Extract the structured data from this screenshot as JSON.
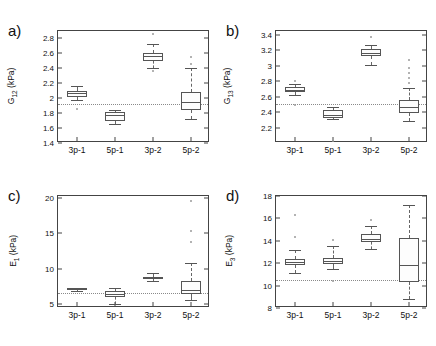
{
  "figure": {
    "background": "#ffffff",
    "panel_letters": [
      "a)",
      "b)",
      "c)",
      "d)"
    ]
  },
  "chart_data": [
    {
      "type": "box",
      "panel": "a)",
      "title": "",
      "xlabel": "",
      "ylabel": "G12 (kPa)",
      "ylabel_base": "G",
      "ylabel_sub": "12",
      "ylabel_units": "(kPa)",
      "categories": [
        "3p-1",
        "5p-1",
        "3p-2",
        "5p-2"
      ],
      "ylim": [
        1.4,
        2.9
      ],
      "yticks": [
        1.4,
        1.6,
        1.8,
        2.0,
        2.2,
        2.4,
        2.6,
        2.8
      ],
      "ytick_labels": [
        "1.4",
        "1.6",
        "1.8",
        "2",
        "2.2",
        "2.4",
        "2.6",
        "2.8"
      ],
      "grid": false,
      "reference_line": 1.92,
      "boxes": [
        {
          "category": "3p-1",
          "whisker_low": 1.97,
          "q1": 2.02,
          "median": 2.07,
          "q3": 2.1,
          "whisker_high": 2.16,
          "outliers": [
            1.86
          ]
        },
        {
          "category": "5p-1",
          "whisker_low": 1.65,
          "q1": 1.7,
          "median": 1.78,
          "q3": 1.81,
          "whisker_high": 1.84,
          "outliers": []
        },
        {
          "category": "3p-2",
          "whisker_low": 2.41,
          "q1": 2.5,
          "median": 2.56,
          "q3": 2.6,
          "whisker_high": 2.72,
          "outliers": [
            2.86,
            2.37
          ]
        },
        {
          "category": "5p-2",
          "whisker_low": 1.72,
          "q1": 1.84,
          "median": 1.95,
          "q3": 2.08,
          "whisker_high": 2.4,
          "outliers": [
            2.55,
            2.46
          ]
        }
      ]
    },
    {
      "type": "box",
      "panel": "b)",
      "title": "",
      "xlabel": "",
      "ylabel": "G13 (kPa)",
      "ylabel_base": "G",
      "ylabel_sub": "13",
      "ylabel_units": "(kPa)",
      "categories": [
        "3p-1",
        "5p-1",
        "3p-2",
        "5p-2"
      ],
      "ylim": [
        2.0,
        3.45
      ],
      "yticks": [
        2.2,
        2.4,
        2.6,
        2.8,
        3.0,
        3.2,
        3.4
      ],
      "ytick_labels": [
        "2.2",
        "2.4",
        "2.6",
        "2.8",
        "3",
        "3.2",
        "3.4"
      ],
      "grid": false,
      "reference_line": 2.5,
      "boxes": [
        {
          "category": "3p-1",
          "whisker_low": 2.62,
          "q1": 2.66,
          "median": 2.69,
          "q3": 2.72,
          "whisker_high": 2.76,
          "outliers": [
            2.8,
            2.49
          ]
        },
        {
          "category": "5p-1",
          "whisker_low": 2.31,
          "q1": 2.33,
          "median": 2.36,
          "q3": 2.43,
          "whisker_high": 2.47,
          "outliers": [
            2.03
          ]
        },
        {
          "category": "3p-2",
          "whisker_low": 3.01,
          "q1": 3.12,
          "median": 3.17,
          "q3": 3.22,
          "whisker_high": 3.27,
          "outliers": [
            3.37
          ]
        },
        {
          "category": "5p-2",
          "whisker_low": 2.28,
          "q1": 2.39,
          "median": 2.47,
          "q3": 2.56,
          "whisker_high": 2.71,
          "outliers": [
            3.07,
            2.97,
            2.9,
            2.84,
            2.78
          ]
        }
      ]
    },
    {
      "type": "box",
      "panel": "c)",
      "title": "",
      "xlabel": "",
      "ylabel": "E1 (kPa)",
      "ylabel_base": "E",
      "ylabel_sub": "1",
      "ylabel_units": "(kPa)",
      "categories": [
        "3p-1",
        "5p-1",
        "3p-2",
        "5p-2"
      ],
      "ylim": [
        4.4,
        20.3
      ],
      "yticks": [
        5,
        10,
        15,
        20
      ],
      "ytick_labels": [
        "5",
        "10",
        "15",
        "20"
      ],
      "grid": false,
      "reference_line": 6.5,
      "boxes": [
        {
          "category": "3p-1",
          "whisker_low": 6.8,
          "q1": 6.9,
          "median": 7.05,
          "q3": 7.2,
          "whisker_high": 7.3,
          "outliers": []
        },
        {
          "category": "5p-1",
          "whisker_low": 4.9,
          "q1": 6.0,
          "median": 6.35,
          "q3": 6.8,
          "whisker_high": 7.3,
          "outliers": []
        },
        {
          "category": "3p-2",
          "whisker_low": 8.3,
          "q1": 8.5,
          "median": 8.65,
          "q3": 8.85,
          "whisker_high": 9.3,
          "outliers": []
        },
        {
          "category": "5p-2",
          "whisker_low": 5.6,
          "q1": 6.4,
          "median": 7.0,
          "q3": 8.3,
          "whisker_high": 10.8,
          "outliers": [
            19.6,
            15.3,
            13.8
          ]
        }
      ]
    },
    {
      "type": "box",
      "panel": "d)",
      "title": "",
      "xlabel": "",
      "ylabel": "E3 (kPa)",
      "ylabel_base": "E",
      "ylabel_sub": "3",
      "ylabel_units": "(kPa)",
      "categories": [
        "3p-1",
        "5p-1",
        "3p-2",
        "5p-2"
      ],
      "ylim": [
        8,
        18
      ],
      "yticks": [
        8,
        10,
        12,
        14,
        16,
        18
      ],
      "ytick_labels": [
        "8",
        "10",
        "12",
        "14",
        "16",
        "18"
      ],
      "grid": false,
      "reference_line": 10.5,
      "boxes": [
        {
          "category": "3p-1",
          "whisker_low": 11.1,
          "q1": 11.8,
          "median": 12.1,
          "q3": 12.4,
          "whisker_high": 13.2,
          "outliers": [
            14.3,
            16.3
          ]
        },
        {
          "category": "5p-1",
          "whisker_low": 11.5,
          "q1": 11.9,
          "median": 12.2,
          "q3": 12.5,
          "whisker_high": 13.5,
          "outliers": [
            14.1,
            10.4
          ]
        },
        {
          "category": "3p-2",
          "whisker_low": 13.3,
          "q1": 13.9,
          "median": 14.2,
          "q3": 14.6,
          "whisker_high": 15.3,
          "outliers": [
            15.9
          ]
        },
        {
          "category": "5p-2",
          "whisker_low": 8.8,
          "q1": 10.35,
          "median": 11.85,
          "q3": 14.25,
          "whisker_high": 17.2,
          "outliers": []
        }
      ]
    }
  ]
}
